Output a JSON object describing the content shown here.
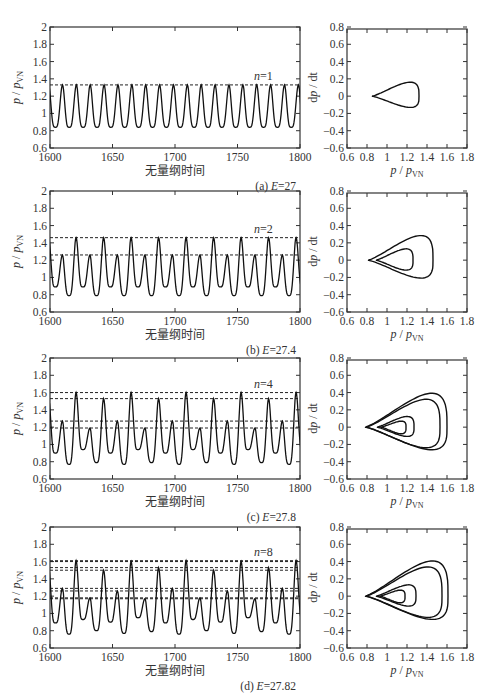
{
  "figure": {
    "panels": [
      {
        "id": "a",
        "caption": "(a) E=27",
        "caption_prefix": "(a) ",
        "caption_var": "E",
        "caption_val": "=27",
        "n_label": "n=1",
        "n_var": "n",
        "n_val": "=1"
      },
      {
        "id": "b",
        "caption": "(b) E=27.4",
        "caption_prefix": "(b) ",
        "caption_var": "E",
        "caption_val": "=27.4",
        "n_label": "n=2",
        "n_var": "n",
        "n_val": "=2"
      },
      {
        "id": "c",
        "caption": "(c) E=27.8",
        "caption_prefix": "(c) ",
        "caption_var": "E",
        "caption_val": "=27.8",
        "n_label": "n=4",
        "n_var": "n",
        "n_val": "=4"
      },
      {
        "id": "d",
        "caption": "(d) E=27.82",
        "caption_prefix": "(d) ",
        "caption_var": "E",
        "caption_val": "=27.82",
        "n_label": "n=8",
        "n_var": "n",
        "n_val": "=8"
      }
    ],
    "time_xlabel": "无量纲时间",
    "time_ylabel": "p / p_VN",
    "phase_xlabel": "p / p_VN",
    "phase_ylabel": "dp / dt"
  },
  "chart_data": [
    {
      "type": "line",
      "panel": "a-left",
      "title": "",
      "xlabel": "无量纲时间",
      "ylabel": "p/p_VN",
      "xlim": [
        1600,
        1800
      ],
      "ylim": [
        0.6,
        2
      ],
      "xticks": [
        1600,
        1650,
        1700,
        1750,
        1800
      ],
      "yticks": [
        0.6,
        0.8,
        1,
        1.2,
        1.4,
        1.6,
        1.8,
        2
      ],
      "period_n": 1,
      "peak_levels": [
        1.33
      ],
      "min_levels": [
        0.84
      ],
      "oscillation_period": 11.1,
      "annotation": "n=1",
      "caption": "(a) E=27"
    },
    {
      "type": "line",
      "panel": "a-right",
      "xlabel": "p/p_VN",
      "ylabel": "dp/dt",
      "xlim": [
        0.6,
        1.8
      ],
      "ylim": [
        -0.6,
        0.8
      ],
      "xticks": [
        0.6,
        0.8,
        1,
        1.2,
        1.4,
        1.6,
        1.8
      ],
      "yticks": [
        -0.6,
        -0.4,
        -0.2,
        0,
        0.2,
        0.4,
        0.6,
        0.8
      ],
      "loops": [
        {
          "p_min": 0.85,
          "p_max": 1.32,
          "dpdt_max": 0.21,
          "dpdt_min": -0.17
        }
      ]
    },
    {
      "type": "line",
      "panel": "b-left",
      "xlabel": "无量纲时间",
      "ylabel": "p/p_VN",
      "xlim": [
        1600,
        1800
      ],
      "ylim": [
        0.6,
        2
      ],
      "xticks": [
        1600,
        1650,
        1700,
        1750,
        1800
      ],
      "yticks": [
        0.6,
        0.8,
        1,
        1.2,
        1.4,
        1.6,
        1.8,
        2
      ],
      "period_n": 2,
      "peak_levels": [
        1.46,
        1.26
      ],
      "min_levels": [
        0.79,
        0.89
      ],
      "annotation": "n=2",
      "caption": "(b) E=27.4"
    },
    {
      "type": "line",
      "panel": "b-right",
      "xlabel": "p/p_VN",
      "ylabel": "dp/dt",
      "xlim": [
        0.6,
        1.8
      ],
      "ylim": [
        -0.6,
        0.8
      ],
      "xticks": [
        0.6,
        0.8,
        1,
        1.2,
        1.4,
        1.6,
        1.8
      ],
      "yticks": [
        -0.6,
        -0.4,
        -0.2,
        0,
        0.2,
        0.4,
        0.6,
        0.8
      ],
      "loops": [
        {
          "p_min": 0.81,
          "p_max": 1.46,
          "dpdt_max": 0.37,
          "dpdt_min": -0.27
        },
        {
          "p_min": 0.89,
          "p_max": 1.26,
          "dpdt_max": 0.17,
          "dpdt_min": -0.15
        }
      ]
    },
    {
      "type": "line",
      "panel": "c-left",
      "xlabel": "无量纲时间",
      "ylabel": "p/p_VN",
      "xlim": [
        1600,
        1800
      ],
      "ylim": [
        0.6,
        2
      ],
      "xticks": [
        1600,
        1650,
        1700,
        1750,
        1800
      ],
      "yticks": [
        0.6,
        0.8,
        1,
        1.2,
        1.4,
        1.6,
        1.8,
        2
      ],
      "period_n": 4,
      "peak_levels": [
        1.6,
        1.53,
        1.27,
        1.19
      ],
      "min_levels": [
        0.77,
        0.79,
        0.9,
        0.94
      ],
      "annotation": "n=4",
      "caption": "(c) E=27.8"
    },
    {
      "type": "line",
      "panel": "c-right",
      "xlabel": "p/p_VN",
      "ylabel": "dp/dt",
      "xlim": [
        0.6,
        1.8
      ],
      "ylim": [
        -0.6,
        0.8
      ],
      "xticks": [
        0.6,
        0.8,
        1,
        1.2,
        1.4,
        1.6,
        1.8
      ],
      "yticks": [
        -0.6,
        -0.4,
        -0.2,
        0,
        0.2,
        0.4,
        0.6,
        0.8
      ],
      "loops": [
        {
          "p_min": 0.78,
          "p_max": 1.6,
          "dpdt_max": 0.51,
          "dpdt_min": -0.34
        },
        {
          "p_min": 0.79,
          "p_max": 1.53,
          "dpdt_max": 0.42,
          "dpdt_min": -0.31
        },
        {
          "p_min": 0.9,
          "p_max": 1.27,
          "dpdt_max": 0.16,
          "dpdt_min": -0.14
        },
        {
          "p_min": 0.94,
          "p_max": 1.19,
          "dpdt_max": 0.09,
          "dpdt_min": -0.1
        }
      ]
    },
    {
      "type": "line",
      "panel": "d-left",
      "xlabel": "无量纲时间",
      "ylabel": "p/p_VN",
      "xlim": [
        1600,
        1800
      ],
      "ylim": [
        0.6,
        2
      ],
      "xticks": [
        1600,
        1650,
        1700,
        1750,
        1800
      ],
      "yticks": [
        0.6,
        0.8,
        1,
        1.2,
        1.4,
        1.6,
        1.8,
        2
      ],
      "period_n": 8,
      "peak_levels": [
        1.61,
        1.6,
        1.53,
        1.5,
        1.29,
        1.26,
        1.18,
        1.17
      ],
      "min_levels": [
        0.76,
        0.77,
        0.79,
        0.8,
        0.89,
        0.9,
        0.93,
        0.95
      ],
      "annotation": "n=8",
      "caption": "(d) E=27.82"
    },
    {
      "type": "line",
      "panel": "d-right",
      "xlabel": "p/p_VN",
      "ylabel": "dp/dt",
      "xlim": [
        0.6,
        1.8
      ],
      "ylim": [
        -0.6,
        0.8
      ],
      "xticks": [
        0.6,
        0.8,
        1,
        1.2,
        1.4,
        1.6,
        1.8
      ],
      "yticks": [
        -0.6,
        -0.4,
        -0.2,
        0,
        0.2,
        0.4,
        0.6,
        0.8
      ],
      "loops": [
        {
          "p_min": 0.78,
          "p_max": 1.61,
          "dpdt_max": 0.53,
          "dpdt_min": -0.35
        },
        {
          "p_min": 0.79,
          "p_max": 1.55,
          "dpdt_max": 0.44,
          "dpdt_min": -0.32
        },
        {
          "p_min": 0.89,
          "p_max": 1.29,
          "dpdt_max": 0.17,
          "dpdt_min": -0.15
        },
        {
          "p_min": 0.93,
          "p_max": 1.18,
          "dpdt_max": 0.09,
          "dpdt_min": -0.1
        }
      ]
    }
  ]
}
